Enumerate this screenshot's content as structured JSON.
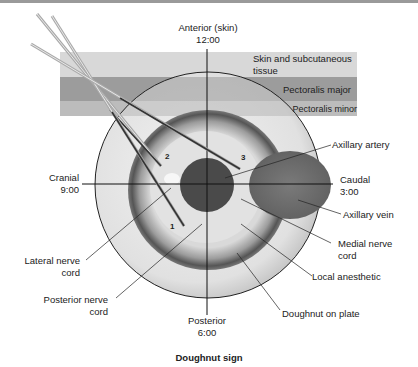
{
  "figure": {
    "caption": "Doughnut sign",
    "axes": {
      "top": {
        "line1": "Anterior (skin)",
        "line2": "12:00"
      },
      "bottom": {
        "line1": "Posterior",
        "line2": "6:00"
      },
      "left": {
        "line1": "Cranial",
        "line2": "9:00"
      },
      "right": {
        "line1": "Caudal",
        "line2": "3:00"
      }
    },
    "layers": [
      {
        "label_line1": "Skin and subcutaneous",
        "label_line2": "tissue",
        "color": "#d6d6d6"
      },
      {
        "label": "Pectoralis major",
        "color": "#9a9a9a"
      },
      {
        "label": "Pectoralis minor",
        "color": "#bdbdbd"
      }
    ],
    "needle_positions": [
      "1",
      "2",
      "3"
    ],
    "labels": {
      "axillary_artery": "Axillary artery",
      "axillary_vein": "Axillary vein",
      "medial_cord_1": "Medial nerve",
      "medial_cord_2": "cord",
      "local_anesthetic": "Local anesthetic",
      "doughnut_on_plate": "Doughnut on plate",
      "lateral_cord_1": "Lateral nerve",
      "lateral_cord_2": "cord",
      "posterior_cord_1": "Posterior nerve",
      "posterior_cord_2": "cord"
    },
    "colors": {
      "artery": "#4a4a4a",
      "vein": "#6e6e6e",
      "plate": "#e8e8e8",
      "doughnut_ring": "#8a8a8a",
      "anesthetic": "#dcdcdc"
    }
  }
}
